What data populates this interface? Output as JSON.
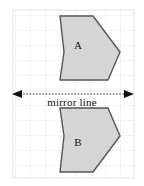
{
  "figure": {
    "type": "reflection-diagram",
    "background_color": "#ffffff",
    "grid": {
      "x": 13,
      "y": 10,
      "width": 121,
      "height": 168,
      "cell_size": 15,
      "line_color": "#e4e4ee",
      "border_color": "#e0e0ec",
      "visible": true
    },
    "mirror_line": {
      "label": "mirror line",
      "y": 94,
      "x_start": 12,
      "x_end": 134,
      "style": "dashed-double-arrow",
      "color": "#222222",
      "label_x": 72,
      "label_y": 100
    },
    "shapes": [
      {
        "label": "A",
        "fill_color": "#d5d5d5",
        "stroke_color": "#555555",
        "label_x": 78,
        "label_y": 45,
        "points": "60,16 93,16 120,52 108,80 60,80 64,52"
      },
      {
        "label": "B",
        "fill_color": "#d5d5d5",
        "stroke_color": "#555555",
        "label_x": 78,
        "label_y": 142,
        "points": "60,172 93,172 120,136 108,108 60,108 64,136"
      }
    ]
  }
}
